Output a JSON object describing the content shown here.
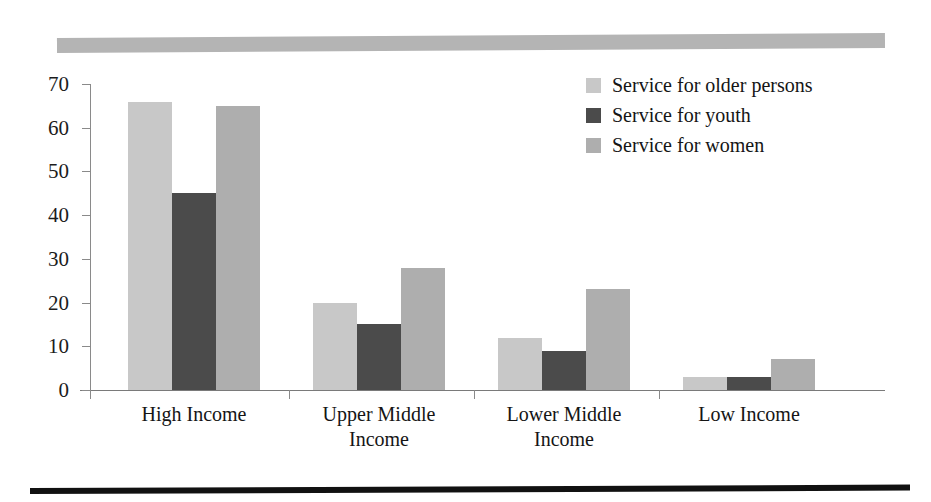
{
  "chart_data": {
    "type": "bar",
    "title": "",
    "xlabel": "",
    "ylabel": "",
    "ylim": [
      0,
      70
    ],
    "yticks": [
      0,
      10,
      20,
      30,
      40,
      50,
      60,
      70
    ],
    "grid": false,
    "legend_position": "top-right",
    "categories": [
      "High Income",
      "Upper Middle\nIncome",
      "Lower Middle\nIncome",
      "Low Income"
    ],
    "series": [
      {
        "name": "Service for older persons",
        "color": "#c8c8c8",
        "values": [
          66,
          20,
          12,
          3
        ]
      },
      {
        "name": "Service for youth",
        "color": "#4b4b4b",
        "values": [
          45,
          15,
          9,
          3
        ]
      },
      {
        "name": "Service for women",
        "color": "#aeaeae",
        "values": [
          65,
          28,
          23,
          7
        ]
      }
    ]
  },
  "decoration": {
    "top_band_color": "#b4b4b4",
    "bottom_rule_color": "#111111"
  }
}
